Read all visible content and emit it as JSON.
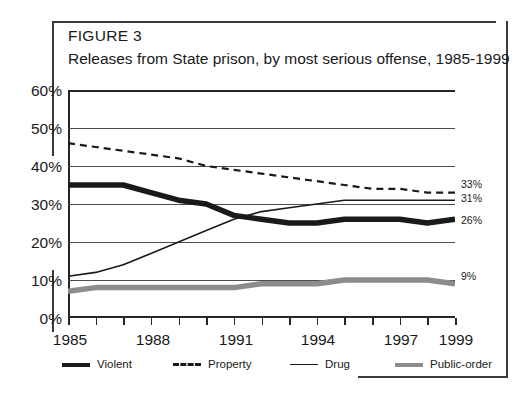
{
  "figure": {
    "label": "FIGURE 3",
    "title": "Releases from State prison, by most serious offense, 1985-1999"
  },
  "axes": {
    "y_ticks": [
      "60%",
      "50%",
      "40%",
      "30%",
      "20%",
      "10%",
      "0%"
    ],
    "x_labels": [
      "1985",
      "1988",
      "1991",
      "1994",
      "1997",
      "1999"
    ]
  },
  "end_labels": {
    "property": "33%",
    "drug": "31%",
    "violent": "26%",
    "public_order": "9%"
  },
  "legend": {
    "items": [
      {
        "label": "Violent",
        "style": "thick-black",
        "color": "#1a1a1a"
      },
      {
        "label": "Property",
        "style": "dashed-black",
        "color": "#1a1a1a"
      },
      {
        "label": "Drug",
        "style": "thin-black",
        "color": "#1a1a1a"
      },
      {
        "label": "Public-order",
        "style": "thick-gray",
        "color": "#8c8c8c"
      }
    ]
  },
  "chart_data": {
    "type": "line",
    "title": "Releases from State prison, by most serious offense, 1985-1999",
    "subtitle": "FIGURE 3",
    "xlabel": "",
    "ylabel": "",
    "x": [
      1985,
      1986,
      1987,
      1988,
      1989,
      1990,
      1991,
      1992,
      1993,
      1994,
      1995,
      1996,
      1997,
      1998,
      1999
    ],
    "xlim": [
      1985,
      1999
    ],
    "ylim": [
      0,
      60
    ],
    "y_unit": "percent",
    "y_tick_values": [
      0,
      10,
      20,
      30,
      40,
      50,
      60
    ],
    "grid": "horizontal",
    "legend_position": "bottom",
    "series": [
      {
        "name": "Violent",
        "style": "thick solid black",
        "color": "#1a1a1a",
        "values": [
          35,
          35,
          35,
          33,
          31,
          30,
          27,
          26,
          25,
          25,
          26,
          26,
          26,
          25,
          26
        ],
        "end_label": "26%"
      },
      {
        "name": "Property",
        "style": "dashed black",
        "color": "#1a1a1a",
        "values": [
          46,
          45,
          44,
          43,
          42,
          40,
          39,
          38,
          37,
          36,
          35,
          34,
          34,
          33,
          33
        ],
        "end_label": "33%"
      },
      {
        "name": "Drug",
        "style": "thin solid black",
        "color": "#1a1a1a",
        "values": [
          11,
          12,
          14,
          17,
          20,
          23,
          26,
          28,
          29,
          30,
          31,
          31,
          31,
          31,
          31
        ],
        "end_label": "31%"
      },
      {
        "name": "Public-order",
        "style": "thick solid gray",
        "color": "#8c8c8c",
        "values": [
          7,
          8,
          8,
          8,
          8,
          8,
          8,
          9,
          9,
          9,
          10,
          10,
          10,
          10,
          9
        ],
        "end_label": "9%"
      }
    ]
  }
}
